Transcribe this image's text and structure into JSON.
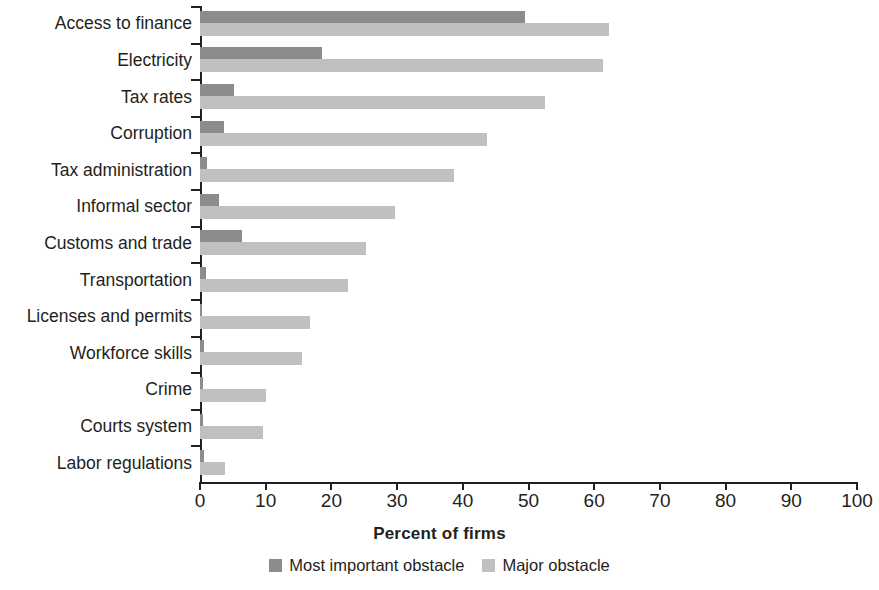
{
  "chart_data": {
    "type": "bar",
    "orientation": "horizontal",
    "title": "",
    "xlabel": "Percent of firms",
    "ylabel": "",
    "xlim": [
      0,
      100
    ],
    "xticks": [
      0,
      10,
      20,
      30,
      40,
      50,
      60,
      70,
      80,
      90,
      100
    ],
    "xtick_labels": [
      "0",
      "10",
      "20",
      "30",
      "40",
      "50",
      "60",
      "70",
      "80",
      "90",
      "100"
    ],
    "grid": false,
    "legend_position": "bottom-center",
    "categories": [
      "Access to finance",
      "Electricity",
      "Tax rates",
      "Corruption",
      "Tax administration",
      "Informal sector",
      "Customs and trade",
      "Transportation",
      "Licenses and permits",
      "Workforce skills",
      "Crime",
      "Courts system",
      "Labor regulations"
    ],
    "series": [
      {
        "name": "Most important obstacle",
        "color": "#8c8c8c",
        "values": [
          49.5,
          18.6,
          5.2,
          3.7,
          1.1,
          2.9,
          6.4,
          0.9,
          0.3,
          0.6,
          0.4,
          0.4,
          0.6
        ]
      },
      {
        "name": "Major obstacle",
        "color": "#c0c0c0",
        "values": [
          62.3,
          61.3,
          52.5,
          43.7,
          38.6,
          29.7,
          25.2,
          22.5,
          16.8,
          15.5,
          10.1,
          9.6,
          3.8
        ]
      }
    ]
  },
  "legend": {
    "items": [
      {
        "label": "Most important obstacle",
        "swatch": "most"
      },
      {
        "label": "Major obstacle",
        "swatch": "major"
      }
    ]
  }
}
